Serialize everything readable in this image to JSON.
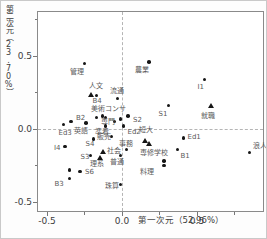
{
  "figure": {
    "x_axis": {
      "title": "第一次元（52.96%）",
      "major": [
        -0.5,
        0.0,
        0.5
      ],
      "major_labels": [
        "-0.5",
        "0.0",
        "0.5"
      ],
      "minor": [
        -0.25,
        0.25,
        0.75
      ]
    },
    "y_axis": {
      "title": "第二次元（23.70%）",
      "major": [
        0.5,
        0.0,
        -0.5
      ],
      "major_labels": [
        "0.5",
        "0.0",
        "-0.5"
      ],
      "minor": [
        0.75,
        0.25,
        -0.25
      ]
    },
    "marker_color": "#161616",
    "refline_color": "#b5b5b5"
  },
  "chart_data": {
    "type": "scatter",
    "title": "",
    "xlabel": "第一次元（52.96%）",
    "ylabel": "第二次元（23.70%）",
    "xlim": [
      -0.56,
      0.94
    ],
    "ylim": [
      -0.56,
      0.8
    ],
    "grid": false,
    "ref_lines": {
      "x": 0,
      "y": 0
    },
    "series": [
      {
        "name": "circle-points",
        "marker": "circle",
        "points": [
          {
            "t": "管理",
            "x": -0.25,
            "y": 0.45,
            "lx": -15,
            "ly": 6
          },
          {
            "t": "農業",
            "x": 0.18,
            "y": 0.46,
            "lx": -14,
            "ly": 5
          },
          {
            "t": "I1",
            "x": 0.55,
            "y": 0.34,
            "lx": -7,
            "ly": 5
          },
          {
            "t": "B4",
            "x": -0.17,
            "y": 0.23,
            "lx": -4,
            "ly": 3
          },
          {
            "t": "流通",
            "x": -0.03,
            "y": 0.21,
            "lx": -8,
            "ly": -10
          },
          {
            "t": "美術コンサ",
            "x": -0.17,
            "y": 0.08,
            "lx": -6,
            "ly": -11
          },
          {
            "t": "",
            "x": -0.13,
            "y": 0.09
          },
          {
            "t": "",
            "x": -0.11,
            "y": 0.08
          },
          {
            "t": "",
            "x": -0.01,
            "y": 0.07
          },
          {
            "t": "S2",
            "x": 0.04,
            "y": 0.09,
            "lx": 5,
            "ly": 1
          },
          {
            "t": "S1",
            "x": 0.31,
            "y": 0.16,
            "lx": -10,
            "ly": 5
          },
          {
            "t": "B2",
            "x": -0.34,
            "y": 0.05,
            "lx": 5,
            "ly": -7
          },
          {
            "t": "専門",
            "x": -0.05,
            "y": 0.05,
            "lx": -14,
            "ly": -3
          },
          {
            "t": "英語",
            "x": -0.24,
            "y": 0.04,
            "lx": -12,
            "ly": 5
          },
          {
            "t": "Ed3",
            "x": -0.39,
            "y": 0.03,
            "lx": -5,
            "ly": 5
          },
          {
            "t": "準看",
            "x": -0.11,
            "y": 0.02,
            "lx": -11,
            "ly": 3
          },
          {
            "t": "Ed2",
            "x": 0.01,
            "y": 0.02,
            "lx": 4,
            "ly": 3
          },
          {
            "t": "販売",
            "x": -0.07,
            "y": -0.05,
            "lx": -15,
            "ly": -2
          },
          {
            "t": "事務",
            "x": 0.03,
            "y": -0.14,
            "lx": -8,
            "ly": -8
          },
          {
            "t": "S4",
            "x": -0.19,
            "y": -0.07,
            "lx": -8,
            "ly": 2
          },
          {
            "t": "I4",
            "x": -0.38,
            "y": -0.12,
            "lx": -11,
            "ly": -2
          },
          {
            "t": "S3",
            "x": -0.21,
            "y": -0.18,
            "lx": -10,
            "ly": -1
          },
          {
            "t": "普通",
            "x": -0.01,
            "y": -0.18,
            "lx": -11,
            "ly": 4
          },
          {
            "t": "B1",
            "x": 0.37,
            "y": -0.14,
            "lx": 3,
            "ly": 4
          },
          {
            "t": "Ed1",
            "x": 0.41,
            "y": -0.06,
            "lx": 4,
            "ly": -4
          },
          {
            "t": "料理",
            "x": 0.28,
            "y": -0.25,
            "lx": -24,
            "ly": 3
          },
          {
            "t": "",
            "x": 0.28,
            "y": -0.22
          },
          {
            "t": "浪人",
            "x": 0.85,
            "y": -0.16,
            "lx": 3,
            "ly": -9
          },
          {
            "t": "S6",
            "x": -0.28,
            "y": -0.29,
            "lx": 5,
            "ly": -2
          },
          {
            "t": "",
            "x": -0.35,
            "y": -0.28
          },
          {
            "t": "B3",
            "x": -0.35,
            "y": -0.34,
            "lx": -15,
            "ly": 2
          },
          {
            "t": "珠算",
            "x": -0.01,
            "y": -0.38,
            "lx": -16,
            "ly": -1
          }
        ]
      },
      {
        "name": "triangle-points",
        "marker": "triangle",
        "points": [
          {
            "t": "人文",
            "x": -0.21,
            "y": 0.23,
            "lx": -2,
            "ly": -12
          },
          {
            "t": "就職",
            "x": 0.59,
            "y": 0.16,
            "lx": -10,
            "ly": 7
          },
          {
            "t": "社会",
            "x": -0.13,
            "y": -0.16,
            "lx": 4,
            "ly": -4
          },
          {
            "t": "理系",
            "x": -0.15,
            "y": -0.2,
            "lx": -10,
            "ly": 3
          },
          {
            "t": "短大",
            "x": 0.15,
            "y": -0.08,
            "lx": -6,
            "ly": -14
          },
          {
            "t": "専修学校",
            "x": 0.18,
            "y": -0.1,
            "lx": -9,
            "ly": 6
          }
        ]
      }
    ]
  }
}
